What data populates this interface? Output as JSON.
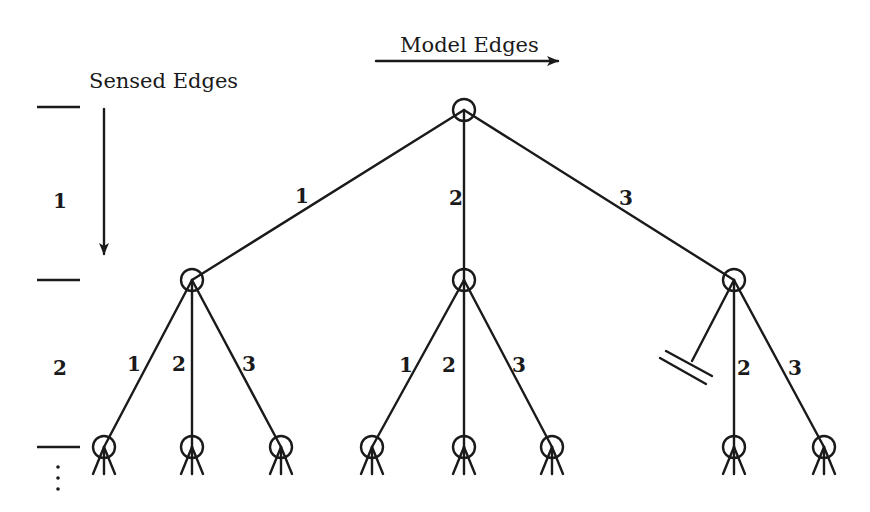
{
  "diagram": {
    "type": "search-tree",
    "labels": {
      "model_edges": "Model Edges",
      "sensed_edges": "Sensed Edges"
    },
    "levels": [
      {
        "label": "1",
        "y_top": 97,
        "y_bottom": 280
      },
      {
        "label": "2",
        "y_top": 280,
        "y_bottom": 447
      }
    ],
    "continuation": "⋮",
    "root": {
      "x": 464,
      "y": 110
    },
    "level1_nodes": [
      {
        "id": "n1",
        "x": 192,
        "y": 280,
        "edge_label": "1"
      },
      {
        "id": "n2",
        "x": 464,
        "y": 280,
        "edge_label": "2"
      },
      {
        "id": "n3",
        "x": 734,
        "y": 280,
        "edge_label": "3"
      }
    ],
    "level2_nodes": [
      {
        "parent": "n1",
        "x": 104,
        "y": 447,
        "edge_label": "1"
      },
      {
        "parent": "n1",
        "x": 192,
        "y": 447,
        "edge_label": "2"
      },
      {
        "parent": "n1",
        "x": 281,
        "y": 447,
        "edge_label": "3"
      },
      {
        "parent": "n2",
        "x": 372,
        "y": 447,
        "edge_label": "1"
      },
      {
        "parent": "n2",
        "x": 464,
        "y": 447,
        "edge_label": "2"
      },
      {
        "parent": "n2",
        "x": 552,
        "y": 447,
        "edge_label": "3"
      },
      {
        "parent": "n3",
        "x": 734,
        "y": 447,
        "edge_label": "2"
      },
      {
        "parent": "n3",
        "x": 824,
        "y": 447,
        "edge_label": "3"
      }
    ],
    "pruned_branch": {
      "parent": "n3",
      "edge_label": "1",
      "symbol": "ground-cut"
    },
    "edge_labels": {
      "root_1": "1",
      "root_2": "2",
      "root_3": "3",
      "n1_1": "1",
      "n1_2": "2",
      "n1_3": "3",
      "n2_1": "1",
      "n2_2": "2",
      "n2_3": "3",
      "n3_2": "2",
      "n3_3": "3"
    }
  }
}
